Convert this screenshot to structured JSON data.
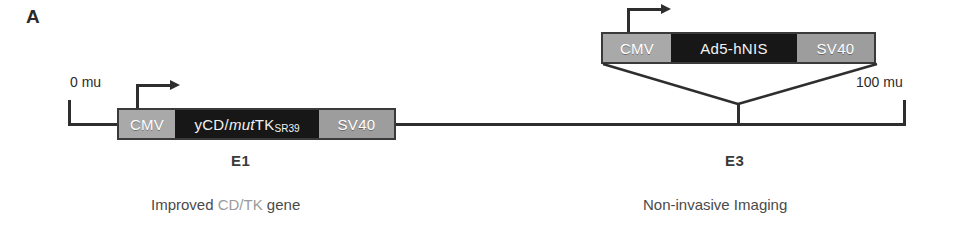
{
  "figure": {
    "panel_label": "A"
  },
  "genome": {
    "left_coordinate": "0 mu",
    "right_coordinate": "100 mu"
  },
  "cassettes": [
    {
      "id": "e1-cassette",
      "region": "E1",
      "promoter": "CMV",
      "gene_prefix": "yCD/",
      "gene_italic": "mut",
      "gene_suffix": "TK",
      "gene_subscript": "SR39",
      "polya": "SV40",
      "region_label": "E1",
      "caption_prefix": "Improved ",
      "caption_highlight": "CD/TK",
      "caption_suffix": " gene"
    },
    {
      "id": "e3-cassette",
      "region": "E3",
      "promoter": "CMV",
      "gene": "Ad5-hNIS",
      "polya": "SV40",
      "region_label": "E3",
      "caption": "Non-invasive Imaging"
    }
  ],
  "colors": {
    "promoter_box": "#a9a9a9",
    "gene_box": "#171717",
    "polya_box": "#9d9d9d",
    "line": "#2e2e2e",
    "background": "#ffffff"
  }
}
